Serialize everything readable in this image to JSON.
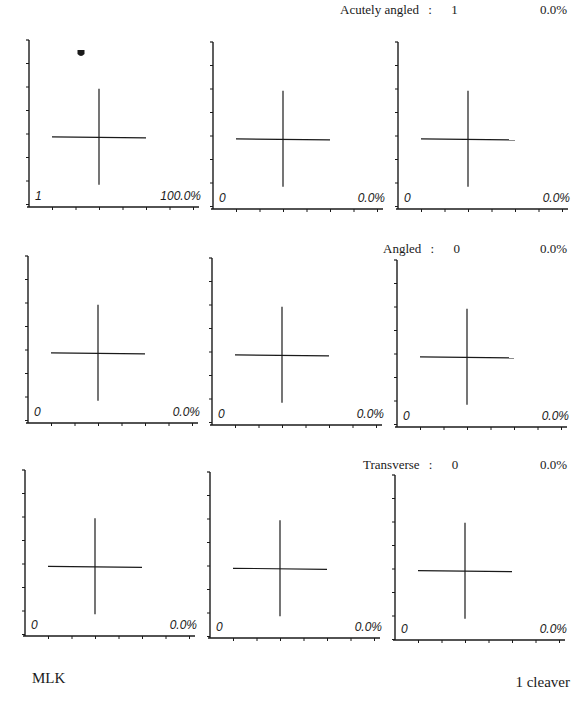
{
  "rows": [
    {
      "label": "Acutely angled",
      "sep": ":",
      "count": "1",
      "percent": "0.0%"
    },
    {
      "label": "Angled",
      "sep": ":",
      "count": "0",
      "percent": "0.0%"
    },
    {
      "label": "Transverse",
      "sep": ":",
      "count": "0",
      "percent": "0.0%"
    }
  ],
  "panels": [
    [
      {
        "count": "1",
        "percent": "100.0%",
        "points": [
          {
            "x": 52,
            "y": 13
          }
        ]
      },
      {
        "count": "0",
        "percent": "0.0%",
        "points": []
      },
      {
        "count": "0",
        "percent": "0.0%",
        "points": []
      }
    ],
    [
      {
        "count": "0",
        "percent": "0.0%",
        "points": []
      },
      {
        "count": "0",
        "percent": "0.0%",
        "points": []
      },
      {
        "count": "0",
        "percent": "0.0%",
        "points": []
      }
    ],
    [
      {
        "count": "0",
        "percent": "0.0%",
        "points": []
      },
      {
        "count": "0",
        "percent": "0.0%",
        "points": []
      },
      {
        "count": "0",
        "percent": "0.0%",
        "points": []
      }
    ]
  ],
  "footer": {
    "left": "MLK",
    "right": "1 cleaver"
  },
  "colors": {
    "ink": "#1a1a1a",
    "background": "#ffffff"
  },
  "chart_data": {
    "type": "scatter",
    "title": "",
    "layout": "3x3 grid of small-multiple scatter panels with crosshair reference",
    "row_labels": [
      "Acutely angled",
      "Angled",
      "Transverse"
    ],
    "row_summary": [
      {
        "label": "Acutely angled",
        "count": 1,
        "percent": 0.0
      },
      {
        "label": "Angled",
        "count": 0,
        "percent": 0.0
      },
      {
        "label": "Transverse",
        "count": 0,
        "percent": 0.0
      }
    ],
    "panels": [
      {
        "row": 1,
        "col": 1,
        "count": 1,
        "percent": 100.0,
        "points": 1
      },
      {
        "row": 1,
        "col": 2,
        "count": 0,
        "percent": 0.0,
        "points": 0
      },
      {
        "row": 1,
        "col": 3,
        "count": 0,
        "percent": 0.0,
        "points": 0
      },
      {
        "row": 2,
        "col": 1,
        "count": 0,
        "percent": 0.0,
        "points": 0
      },
      {
        "row": 2,
        "col": 2,
        "count": 0,
        "percent": 0.0,
        "points": 0
      },
      {
        "row": 2,
        "col": 3,
        "count": 0,
        "percent": 0.0,
        "points": 0
      },
      {
        "row": 3,
        "col": 1,
        "count": 0,
        "percent": 0.0,
        "points": 0
      },
      {
        "row": 3,
        "col": 2,
        "count": 0,
        "percent": 0.0,
        "points": 0
      },
      {
        "row": 3,
        "col": 3,
        "count": 0,
        "percent": 0.0,
        "points": 0
      }
    ],
    "axis_ticks": {
      "x": 7,
      "y": 7
    },
    "grid": false,
    "legend": null,
    "xlabel": "",
    "ylabel": "",
    "annotations": [
      "MLK",
      "1 cleaver"
    ]
  }
}
